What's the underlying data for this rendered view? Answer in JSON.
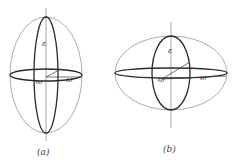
{
  "figure": {
    "panels": [
      {
        "id": "a",
        "caption": "(a)",
        "shape": "prolate ellipsoid",
        "labels": {
          "polar": "ε",
          "radius_back": "ω",
          "radius_front": "ω"
        }
      },
      {
        "id": "b",
        "caption": "(b)",
        "shape": "oblate ellipsoid",
        "labels": {
          "polar": "ε",
          "radius_back": "ω",
          "radius_front": "ω"
        }
      }
    ],
    "colors": {
      "outline": "#8a8a8a",
      "bold": "#2a2a2a",
      "background": "#ffffff"
    }
  }
}
